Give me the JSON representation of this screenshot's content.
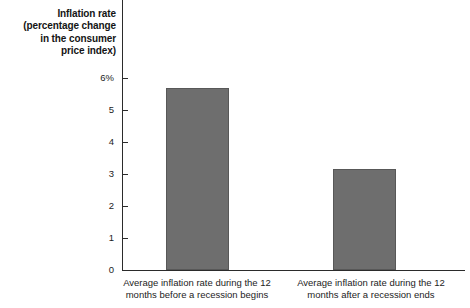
{
  "chart_data": {
    "type": "bar",
    "title": "",
    "subtitle": "",
    "xlabel": "",
    "ylabel": "Inflation rate (percentage change in the consumer price index)",
    "ylabel_lines": [
      "Inflation rate",
      "(percentage change",
      "in the consumer",
      "price index)"
    ],
    "categories": [
      "Average inflation rate during the 12 months before a recession begins",
      "Average inflation rate during the 12 months after a recession ends"
    ],
    "category_lines": [
      [
        "Average inflation rate during the 12",
        "months before a recession begins"
      ],
      [
        "Average inflation rate during the 12",
        "months after a recession ends"
      ]
    ],
    "values": [
      5.7,
      3.15
    ],
    "ylim": [
      0,
      6
    ],
    "yticks": [
      0,
      1,
      2,
      3,
      4,
      5,
      6
    ],
    "ytick_labels": [
      "0",
      "1",
      "2",
      "3",
      "4",
      "5",
      "6%"
    ],
    "grid": false,
    "legend": null,
    "legend_position": "none",
    "bar_color": "#6e6e6e",
    "bar_border_color": "#585858",
    "axis_color": "#2b2b2b",
    "background": "#ffffff"
  }
}
